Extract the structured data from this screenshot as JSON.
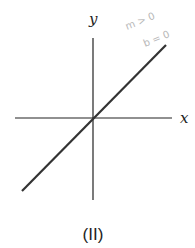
{
  "diagram": {
    "caption": "(II)",
    "x_axis_label": "x",
    "y_axis_label": "y",
    "annotations": [
      "m > 0",
      "b = 0"
    ],
    "line": {
      "description": "line through origin with positive slope",
      "slope_sign": "positive",
      "intercept": 0
    },
    "colors": {
      "axes": "#222222",
      "line": "#333333",
      "annotation": "#b8b8b8"
    }
  }
}
